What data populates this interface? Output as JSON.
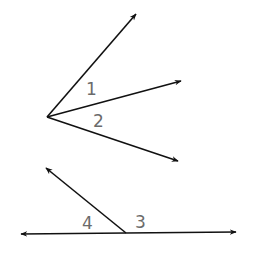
{
  "diagram": {
    "type": "angle-figures",
    "colors": {
      "line": "#111111",
      "label": "#6b6b6b",
      "background": "#ffffff"
    },
    "figures": [
      {
        "name": "figure-top",
        "vertex": [
          47,
          117
        ],
        "rays": [
          {
            "name": "ray-upper",
            "tip": [
              136,
              14
            ]
          },
          {
            "name": "ray-middle",
            "tip": [
              181,
              81
            ]
          },
          {
            "name": "ray-lower",
            "tip": [
              178,
              161
            ]
          }
        ],
        "labels": [
          {
            "text": "1",
            "x": 86,
            "y": 95
          },
          {
            "text": "2",
            "x": 93,
            "y": 127
          }
        ]
      },
      {
        "name": "figure-bottom",
        "vertex": [
          126,
          233
        ],
        "rays": [
          {
            "name": "ray-slanted",
            "tip": [
              46,
              168
            ]
          },
          {
            "name": "line-left",
            "tip": [
              21,
              234
            ]
          },
          {
            "name": "line-right",
            "tip": [
              236,
              232
            ]
          }
        ],
        "labels": [
          {
            "text": "4",
            "x": 82,
            "y": 229
          },
          {
            "text": "3",
            "x": 135,
            "y": 228
          }
        ]
      }
    ]
  }
}
